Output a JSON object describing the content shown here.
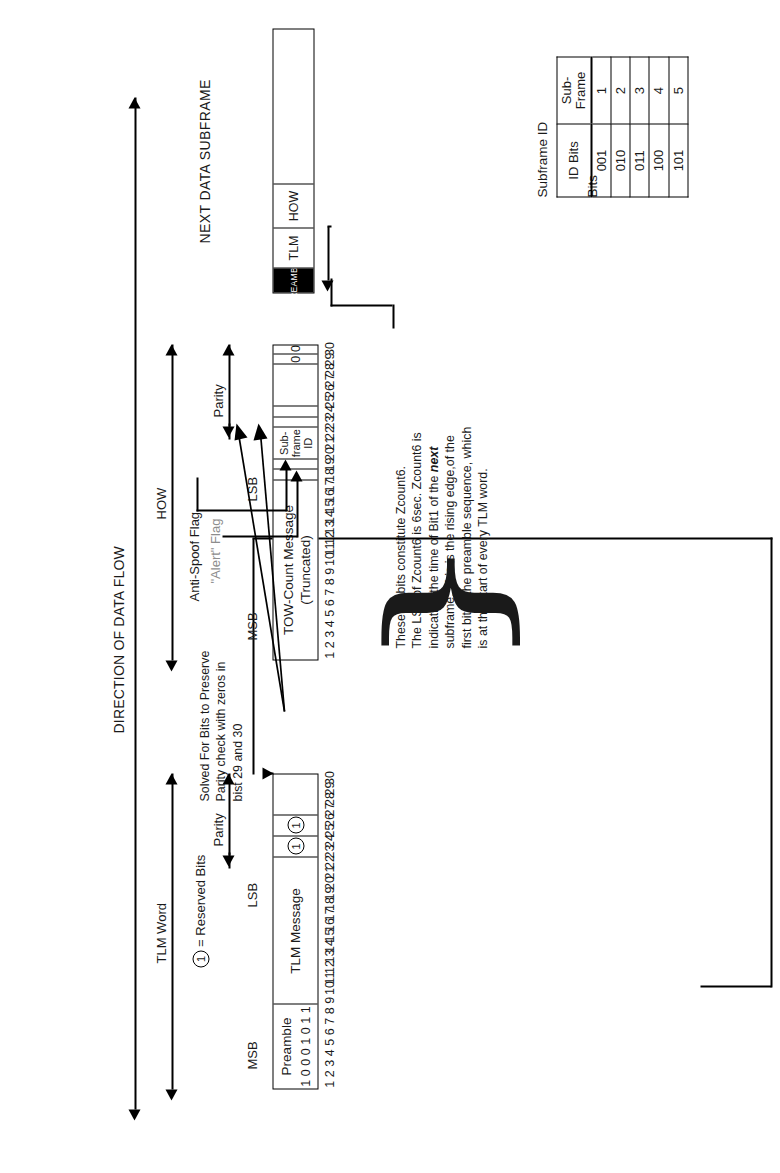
{
  "diagram": {
    "direction_label": "DIRECTION OF DATA FLOW",
    "legend": {
      "symbol": "1",
      "text": "= Reserved Bits"
    }
  },
  "tlm_word": {
    "span_label": "TLM Word",
    "parity_label": "Parity",
    "msb_label": "MSB",
    "lsb_label": "LSB",
    "preamble": {
      "label": "Preamble",
      "bits": [
        "1",
        "0",
        "0",
        "0",
        "1",
        "0",
        "1",
        "1"
      ],
      "bit_range": "1-8"
    },
    "message": {
      "label": "TLM Message",
      "bit_range": "9-22"
    },
    "reserved": {
      "bits": [
        "1",
        "1"
      ],
      "bit_range": "23-24"
    },
    "parity": {
      "bit_range": "25-30"
    },
    "bit_numbers": [
      "1",
      "2",
      "3",
      "4",
      "5",
      "6",
      "7",
      "8",
      "9",
      "10",
      "11",
      "12",
      "13",
      "14",
      "15",
      "16",
      "17",
      "18",
      "19",
      "20",
      "21",
      "22",
      "23",
      "24",
      "25",
      "26",
      "27",
      "28",
      "29",
      "30"
    ]
  },
  "how_word": {
    "span_label": "HOW",
    "parity_label": "Parity",
    "msb_label": "MSB",
    "lsb_label": "LSB",
    "tow": {
      "label": "TOW-Count Message",
      "sublabel": "(Truncated)",
      "bit_range": "1-17"
    },
    "alert_flag_label": "\"Alert\" Flag",
    "anti_spoof_label": "Anti-Spoof Flag",
    "subframe_id": {
      "label_line1": "Sub-",
      "label_line2": "frame",
      "label_line3": "ID",
      "bit_range": "20-22"
    },
    "solved_bits_note": "Solved For Bits to Preserve\nParity check with zeros in\nbist 29 and 30",
    "zero_bits": [
      "0",
      "0"
    ],
    "parity": {
      "bit_range": "25-30"
    },
    "bit_numbers": [
      "1",
      "2",
      "3",
      "4",
      "5",
      "6",
      "7",
      "8",
      "9",
      "10",
      "11",
      "12",
      "13",
      "14",
      "15",
      "16",
      "17",
      "18",
      "19",
      "20",
      "21",
      "22",
      "23",
      "24",
      "25",
      "26",
      "27",
      "28",
      "29",
      "30"
    ]
  },
  "tow_note": "These 17 bits constitute Zcount6.\nThe LSB of Zcount6 is 6sec. Zcount6 is\nindicating the time of Bit1 of the next\nsubframe. This is the rising edge,of the\nfirst bit of the preamble sequence, which\nis at the start of every TLM word.",
  "next_subframe": {
    "title": "NEXT DATA SUBFRAME",
    "preamble_label": "PREAMBLE",
    "tlm_label": "TLM",
    "how_label": "HOW"
  },
  "subframe_id_table": {
    "title_line1": "Subframe ID",
    "title_line2": "Bits",
    "headers": [
      "ID Bits",
      "Sub-\nFrame"
    ],
    "rows": [
      {
        "id_bits": "001",
        "subframe": "1"
      },
      {
        "id_bits": "010",
        "subframe": "2"
      },
      {
        "id_bits": "011",
        "subframe": "3"
      },
      {
        "id_bits": "100",
        "subframe": "4"
      },
      {
        "id_bits": "101",
        "subframe": "5"
      }
    ]
  }
}
